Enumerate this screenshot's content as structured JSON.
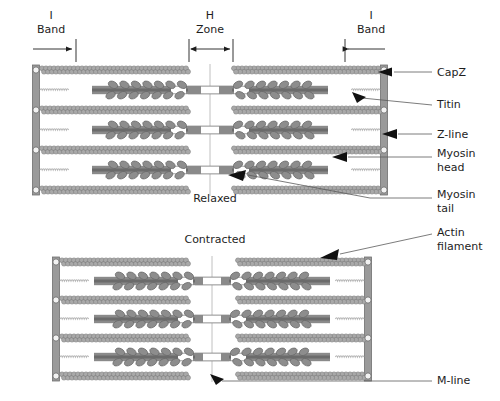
{
  "diagram": {
    "title_hidden": "",
    "top_annotations": [
      {
        "id": "i-band-left",
        "line1": "I",
        "line2": "Band"
      },
      {
        "id": "h-zone",
        "line1": "H",
        "line2": "Zone"
      },
      {
        "id": "i-band-right",
        "line1": "I",
        "line2": "Band"
      }
    ],
    "state_labels": [
      {
        "id": "relaxed",
        "text": "Relaxed"
      },
      {
        "id": "contracted",
        "text": "Contracted"
      }
    ],
    "callouts": [
      {
        "id": "capz",
        "text": "CapZ"
      },
      {
        "id": "titin",
        "text": "Titin"
      },
      {
        "id": "z-line",
        "text": "Z-line"
      },
      {
        "id": "myosin-head",
        "text": "Myosin",
        "text2": "head"
      },
      {
        "id": "myosin-tail",
        "text": "Myosin",
        "text2": "tail"
      },
      {
        "id": "actin-filament",
        "text": "Actin",
        "text2": "filament"
      },
      {
        "id": "m-line",
        "text": "M-line"
      }
    ],
    "colors": {
      "background": "#ffffff",
      "z_line": "#9a9a9a",
      "z_line_edge": "#6f6f6f",
      "capz": "#f2f2f2",
      "actin_bead": "#a9a9a9",
      "actin_bead_edge": "#7e7e7e",
      "myosin_tail": "#8a8a8a",
      "myosin_core": "#6b6b6b",
      "myosin_head": "#8d8d8d",
      "myosin_head_edge": "#666666",
      "titin": "#b4b4b4",
      "m_line": "#b9b9b9",
      "text": "#1d1d1d",
      "leader": "#5a5a5a"
    }
  }
}
